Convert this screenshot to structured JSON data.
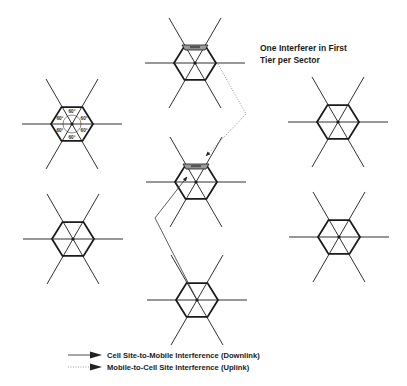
{
  "diagram": {
    "title_line1": "One Interferer in First",
    "title_line2": "Tier per Sector",
    "angle_label": "60°",
    "cells": [
      {
        "id": "left-top",
        "cx": 72,
        "cy": 124,
        "labeled_angles": true
      },
      {
        "id": "left-bottom",
        "cx": 73,
        "cy": 239,
        "labeled_angles": false
      },
      {
        "id": "center-top",
        "cx": 195,
        "cy": 63,
        "labeled_angles": false,
        "has_mobile": true
      },
      {
        "id": "center-middle",
        "cx": 196,
        "cy": 182,
        "labeled_angles": false,
        "has_mobile": true
      },
      {
        "id": "center-bottom",
        "cx": 197,
        "cy": 300,
        "labeled_angles": false
      },
      {
        "id": "right-top",
        "cx": 338,
        "cy": 122,
        "labeled_angles": false
      },
      {
        "id": "right-bottom",
        "cx": 339,
        "cy": 237,
        "labeled_angles": false
      }
    ],
    "paths": {
      "downlink": {
        "style": "solid",
        "points": [
          [
            197,
            300
          ],
          [
            155,
            218
          ],
          [
            187,
            177
          ]
        ]
      },
      "uplink": {
        "style": "dotted",
        "points": [
          [
            218,
            64
          ],
          [
            246,
            114
          ],
          [
            206,
            156
          ]
        ]
      }
    }
  },
  "legend": {
    "items": [
      {
        "label": "Cell Site-to-Mobile Interference (Downlink)",
        "line": "solid"
      },
      {
        "label": "Mobile-to-Cell Site Interference (Uplink)",
        "line": "dotted"
      }
    ]
  },
  "colors": {
    "line": "#1a1a1a",
    "dotted": "#777777",
    "background": "#ffffff"
  }
}
